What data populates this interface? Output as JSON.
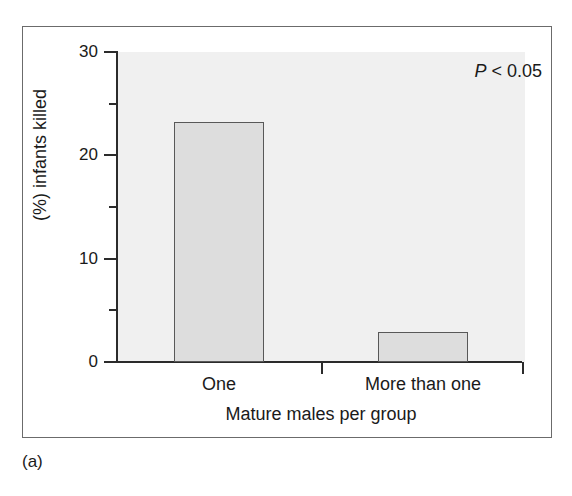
{
  "figure": {
    "caption": "(a)",
    "frame_color": "#6b6b6b",
    "panel_bg": "#f0f0f0",
    "bar_fill": "#dddddd",
    "bar_stroke": "#585858",
    "axis_color": "#2b2b2b"
  },
  "chart_data": {
    "type": "bar",
    "title": "",
    "subtitle": "",
    "categories": [
      "One",
      "More than one"
    ],
    "values": [
      23.2,
      2.9
    ],
    "series": [
      {
        "name": "(%) infants killed",
        "values": [
          23.2,
          2.9
        ]
      }
    ],
    "xlabel": "Mature males per group",
    "ylabel": "(%) infants killed",
    "ylim": [
      0,
      30
    ],
    "ytick_major": [
      0,
      10,
      20,
      30
    ],
    "ytick_major_labels": [
      "0",
      "10",
      "20",
      "30"
    ],
    "ytick_minor": [
      5,
      15,
      25
    ],
    "grid": false,
    "legend": false,
    "legend_position": "none",
    "annotations": [
      {
        "name": "p-value",
        "symbol": "P",
        "text": " < 0.05",
        "full_text": "P < 0.05",
        "position": "top-right"
      }
    ]
  }
}
